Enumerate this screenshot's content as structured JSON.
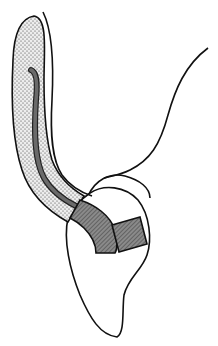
{
  "diagram": {
    "type": "anatomical line drawing",
    "colors": {
      "background": "#ffffff",
      "outline": "#111111",
      "stipple_fill": "#e9e9e9",
      "stipple_dot": "#3a3a3a",
      "hatch_fill": "#7a7a7a",
      "hatch_line": "#2a2a2a",
      "inner_strip": "#5a5a5a"
    },
    "parts": [
      {
        "name": "stippled-tissue-band",
        "description": "elongated curved stippled band"
      },
      {
        "name": "inner-dark-strip",
        "description": "dark curved strip running inside stippled band"
      },
      {
        "name": "outer-contour-line",
        "description": "thin curved line running along the right of the band"
      },
      {
        "name": "crown-outline",
        "description": "rounded crown outline at top of tooth"
      },
      {
        "name": "tooth-root",
        "description": "tapered root outline pointing downward"
      },
      {
        "name": "hatched-block-curved",
        "description": "curved hatched block continuing the band"
      },
      {
        "name": "hatched-block-rect",
        "description": "rectangular hatched block on the crown"
      },
      {
        "name": "right-contour-line",
        "description": "S-shaped line from upper right down to crown"
      }
    ]
  }
}
